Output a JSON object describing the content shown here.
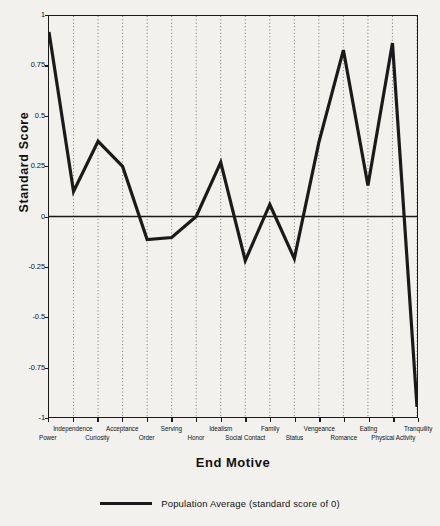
{
  "chart_data": {
    "type": "line",
    "title": "",
    "xlabel": "End Motive",
    "ylabel": "Standard Score",
    "ylim": [
      -1,
      1
    ],
    "yticks": [
      1,
      0.75,
      0.5,
      0.25,
      0,
      -0.25,
      -0.5,
      -0.75,
      -1
    ],
    "ytick_labels": [
      "1",
      "0.75",
      "0.5",
      "0.25",
      "0",
      "-0.25",
      "-0.5",
      "-0.75",
      "-1"
    ],
    "grid": "vertical-dotted",
    "legend_position": "bottom-center",
    "zero_line": true,
    "categories": [
      "Power",
      "Independence",
      "Curiosity",
      "Acceptance",
      "Order",
      "Serving",
      "Honor",
      "Idealism",
      "Social Contact",
      "Family",
      "Status",
      "Vengeance",
      "Romance",
      "Eating",
      "Physical Activity",
      "Tranquility"
    ],
    "series": [
      {
        "name": "End Motive standard score",
        "color": "#1a1a1a",
        "values": [
          0.92,
          0.125,
          0.375,
          0.25,
          -0.115,
          -0.105,
          0.0,
          0.27,
          -0.22,
          0.06,
          -0.21,
          0.37,
          0.83,
          0.155,
          0.865,
          -0.95
        ]
      }
    ],
    "legend": [
      {
        "label": "Population Average (standard score of 0)",
        "color": "#1a1a1a",
        "marker": "line"
      }
    ]
  },
  "axis": {
    "x_title": "End Motive",
    "y_title": "Standard Score"
  },
  "legend_text": "Population Average (standard score of 0)"
}
